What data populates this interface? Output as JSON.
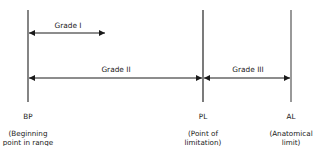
{
  "diagram": {
    "type": "joint-mobilization-grades",
    "colors": {
      "line": "#1a1a1a",
      "background": "#ffffff"
    },
    "markers": [
      {
        "id": "BP",
        "abbr": "BP",
        "description": "(Beginning\npoint in range\nof motion)",
        "x": 28
      },
      {
        "id": "PL",
        "abbr": "PL",
        "description": "(Point of\nlimitation)",
        "x": 203
      },
      {
        "id": "AL",
        "abbr": "AL",
        "description": "(Anatomical\nlimit)",
        "x": 291
      }
    ],
    "grades": [
      {
        "label": "Grade I",
        "from": "BP",
        "to_x": 105,
        "y": 33
      },
      {
        "label": "Grade II",
        "from": "BP",
        "to": "PL",
        "y": 78
      },
      {
        "label": "Grade III",
        "from": "PL",
        "to": "AL",
        "y": 78
      }
    ]
  }
}
